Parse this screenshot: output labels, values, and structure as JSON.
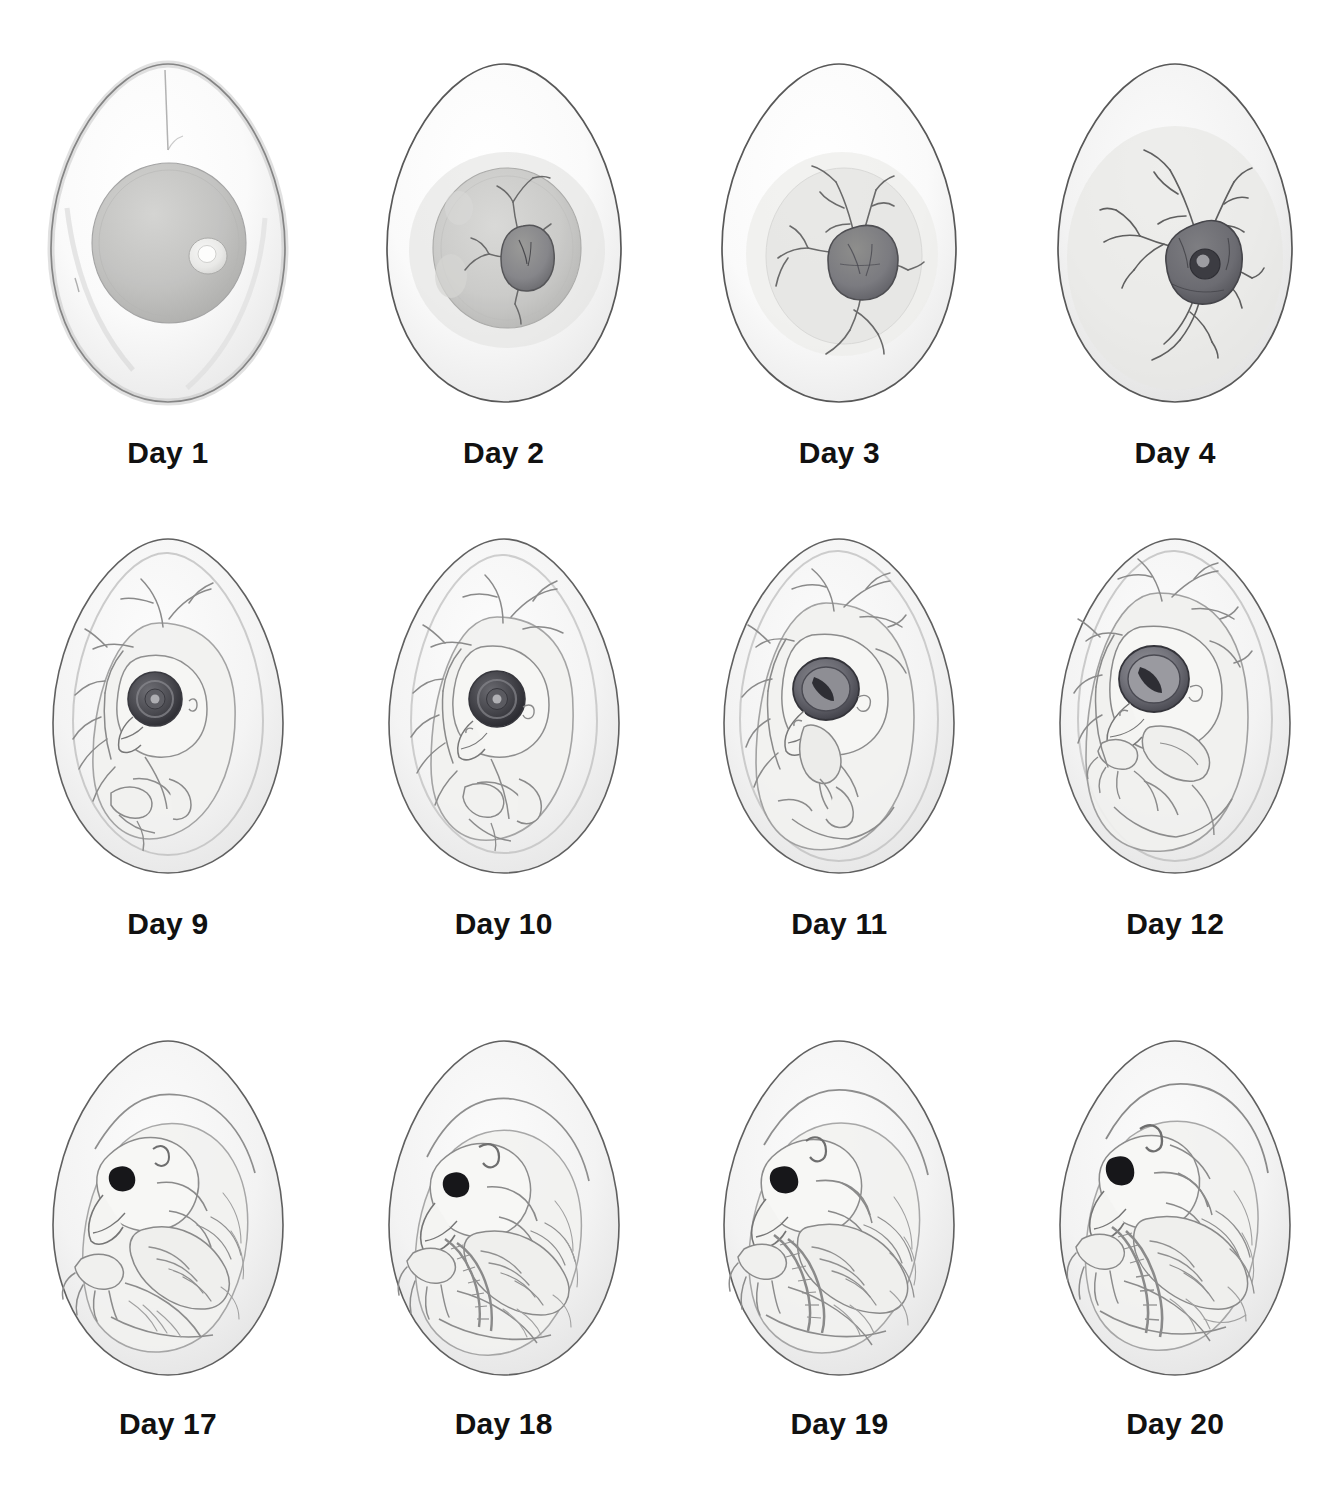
{
  "figure": {
    "background_color": "#ffffff",
    "ink_color": "#6b6b6b",
    "label_color": "#111111",
    "columns": 4,
    "rows": 3,
    "medium": "pencil-drawing"
  },
  "stages": [
    {
      "label": "Day 1",
      "day": 1,
      "row": 1,
      "column": 1,
      "icon": "egg-day-1-icon",
      "description": "Egg with large round yolk and small pale germinal disc",
      "features": [
        "yolk",
        "germinal-disc",
        "albumen",
        "chalaza"
      ],
      "embryo_visible": false,
      "vessels_visible": false,
      "eye_visible": false
    },
    {
      "label": "Day 2",
      "day": 2,
      "row": 1,
      "column": 2,
      "icon": "egg-day-2-icon",
      "description": "Small dark embryo on yolk with first branching blood vessels",
      "features": [
        "yolk",
        "embryo",
        "blood-vessels"
      ],
      "embryo_visible": true,
      "vessels_visible": true,
      "eye_visible": false
    },
    {
      "label": "Day 3",
      "day": 3,
      "row": 1,
      "column": 3,
      "icon": "egg-day-3-icon",
      "description": "Enlarged embryo mass with spreading vascular network",
      "features": [
        "yolk",
        "embryo",
        "blood-vessels"
      ],
      "embryo_visible": true,
      "vessels_visible": true,
      "eye_visible": false
    },
    {
      "label": "Day 4",
      "day": 4,
      "row": 1,
      "column": 4,
      "icon": "egg-day-4-icon",
      "description": "Dark embryo with forming eye spot and extensive vessel network filling the egg",
      "features": [
        "embryo",
        "eye-spot",
        "blood-vessels"
      ],
      "embryo_visible": true,
      "vessels_visible": true,
      "eye_visible": true
    },
    {
      "label": "Day 9",
      "day": 9,
      "row": 2,
      "column": 1,
      "icon": "egg-day-9-icon",
      "description": "Curled embryo with large dark eye, beak and limb buds surrounded by vessels",
      "features": [
        "embryo-body",
        "large-eye",
        "beak",
        "limb-buds",
        "blood-vessels"
      ],
      "embryo_visible": true,
      "vessels_visible": true,
      "eye_visible": true
    },
    {
      "label": "Day 10",
      "day": 10,
      "row": 2,
      "column": 2,
      "icon": "egg-day-10-icon",
      "description": "Embryo with defined beak, ear opening and developing wing and leg",
      "features": [
        "embryo-body",
        "large-eye",
        "beak",
        "wing",
        "leg",
        "blood-vessels"
      ],
      "embryo_visible": true,
      "vessels_visible": true,
      "eye_visible": true
    },
    {
      "label": "Day 11",
      "day": 11,
      "row": 2,
      "column": 3,
      "icon": "egg-day-11-icon",
      "description": "Larger embryo, eye with visible pupil slit, toes beginning to separate",
      "features": [
        "embryo-body",
        "eye-with-pupil",
        "beak",
        "toes",
        "blood-vessels"
      ],
      "embryo_visible": true,
      "vessels_visible": true,
      "eye_visible": true
    },
    {
      "label": "Day 12",
      "day": 12,
      "row": 2,
      "column": 4,
      "icon": "egg-day-12-icon",
      "description": "Embryo nearly filling egg with folded wing, clawed foot and open eye",
      "features": [
        "embryo-body",
        "eye-with-pupil",
        "beak",
        "claws",
        "blood-vessels"
      ],
      "embryo_visible": true,
      "vessels_visible": true,
      "eye_visible": true
    },
    {
      "label": "Day 17",
      "day": 17,
      "row": 3,
      "column": 1,
      "icon": "egg-day-17-icon",
      "description": "Feathered chick curled in egg, eye closed to a dark slit, claws tucked forward",
      "features": [
        "feathered-chick",
        "closed-eye",
        "beak",
        "claws",
        "down-feathers"
      ],
      "embryo_visible": true,
      "vessels_visible": false,
      "eye_visible": true
    },
    {
      "label": "Day 18",
      "day": 18,
      "row": 3,
      "column": 2,
      "icon": "egg-day-18-icon",
      "description": "Chick fully feathered with scaled leg drawn up and toes spread",
      "features": [
        "feathered-chick",
        "closed-eye",
        "beak",
        "scaled-leg",
        "toes",
        "ear-opening"
      ],
      "embryo_visible": true,
      "vessels_visible": false,
      "eye_visible": true
    },
    {
      "label": "Day 19",
      "day": 19,
      "row": 3,
      "column": 3,
      "icon": "egg-day-19-icon",
      "description": "Chick in hatching position, head tucked under wing, legs folded tight",
      "features": [
        "feathered-chick",
        "closed-eye",
        "beak",
        "scaled-leg",
        "toes",
        "air-cell"
      ],
      "embryo_visible": true,
      "vessels_visible": false,
      "eye_visible": true
    },
    {
      "label": "Day 20",
      "day": 20,
      "row": 3,
      "column": 4,
      "icon": "egg-day-20-icon",
      "description": "Fully developed chick filling the shell, ready to pip and hatch",
      "features": [
        "feathered-chick",
        "closed-eye",
        "egg-tooth",
        "scaled-leg",
        "toes",
        "air-cell"
      ],
      "embryo_visible": true,
      "vessels_visible": false,
      "eye_visible": true
    }
  ]
}
